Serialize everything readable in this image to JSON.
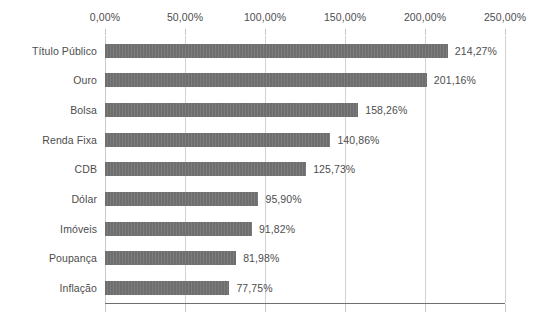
{
  "chart_data": {
    "type": "bar",
    "orientation": "horizontal",
    "title": "",
    "subtitle": "",
    "xlabel": "",
    "ylabel": "",
    "xlim": [
      0,
      250
    ],
    "grid": true,
    "legend": false,
    "legend_position": "none",
    "axis_position": "top",
    "value_suffix": "%",
    "decimal_separator": ",",
    "bar_color": "#6e6e6e",
    "gridline_color": "#d2d2d2",
    "text_color": "#4d4d4d",
    "categories": [
      "Título Público",
      "Ouro",
      "Bolsa",
      "Renda Fixa",
      "CDB",
      "Dólar",
      "Imóveis",
      "Poupança",
      "Inflação"
    ],
    "values": [
      214.27,
      201.16,
      158.26,
      140.86,
      125.73,
      95.9,
      91.82,
      81.98,
      77.75
    ],
    "value_labels": [
      "214,27%",
      "201,16%",
      "158,26%",
      "140,86%",
      "125,73%",
      "95,90%",
      "91,82%",
      "81,98%",
      "77,75%"
    ],
    "xticks": [
      0,
      50,
      100,
      150,
      200,
      250
    ],
    "xtick_labels": [
      "0,00%",
      "50,00%",
      "100,00%",
      "150,00%",
      "200,00%",
      "250,00%"
    ]
  }
}
